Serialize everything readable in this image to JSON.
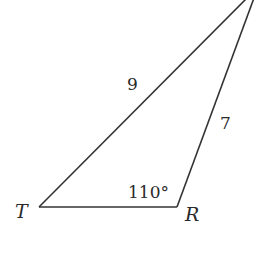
{
  "diagram": {
    "type": "triangle",
    "stroke_color": "#333333",
    "text_color": "#2a2a2a",
    "vertices": [
      {
        "name": "T",
        "label": "T",
        "x": 39,
        "y": 207
      },
      {
        "name": "R",
        "label": "R",
        "x": 177,
        "y": 207
      },
      {
        "name": "top",
        "label": "",
        "x": 247,
        "y": -2
      }
    ],
    "sides": [
      {
        "between": [
          "T",
          "top"
        ],
        "label": "9"
      },
      {
        "between": [
          "R",
          "top"
        ],
        "label": "7"
      },
      {
        "between": [
          "T",
          "R"
        ],
        "label": ""
      }
    ],
    "angles": [
      {
        "at": "R",
        "label": "110°"
      }
    ]
  }
}
